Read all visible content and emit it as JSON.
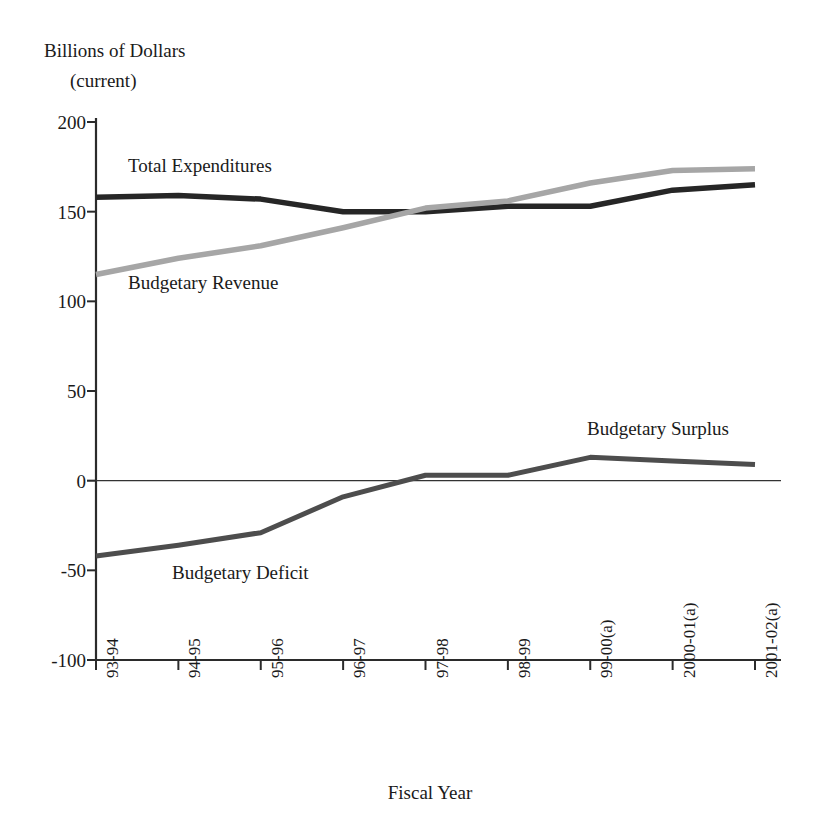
{
  "chart_data": {
    "type": "line",
    "title": "",
    "ylabel": "Billions of Dollars",
    "ylabel_line2": "(current)",
    "xlabel": "Fiscal Year",
    "categories": [
      "93-94",
      "94-95",
      "95-96",
      "96-97",
      "97-98",
      "98-99",
      "99-00(a)",
      "2000-01(a)",
      "2001-02(a)"
    ],
    "ylim": [
      -100,
      200
    ],
    "yticks": [
      200,
      150,
      100,
      50,
      0,
      -50,
      -100
    ],
    "ytick_labels": [
      "200",
      "150",
      "100",
      "50",
      "0",
      "-50",
      "-100"
    ],
    "grid": false,
    "legend_position": "inline-annotations",
    "series": [
      {
        "name": "Total Expenditures",
        "color": "#262626",
        "values": [
          158,
          159,
          157,
          150,
          150,
          153,
          153,
          162,
          165
        ]
      },
      {
        "name": "Budgetary Revenue",
        "color": "#a6a6a6",
        "values": [
          115,
          124,
          131,
          141,
          152,
          156,
          166,
          173,
          174
        ]
      },
      {
        "name": "Budgetary Balance",
        "color": "#4d4d4d",
        "values": [
          -42,
          -36,
          -29,
          -9,
          3,
          3,
          13,
          11,
          9
        ]
      }
    ],
    "annotations": [
      {
        "text": "Total Expenditures",
        "series": "Total Expenditures"
      },
      {
        "text": "Budgetary Revenue",
        "series": "Budgetary Revenue"
      },
      {
        "text": "Budgetary Deficit",
        "series": "Budgetary Balance"
      },
      {
        "text": "Budgetary Surplus",
        "series": "Budgetary Balance"
      }
    ]
  },
  "axis": {
    "y_title": "Billions of Dollars",
    "y_title_line2": "(current)",
    "x_title": "Fiscal Year",
    "y_ticks": [
      "200",
      "150",
      "100",
      "50",
      "0",
      "-50",
      "-100"
    ],
    "x_ticks": [
      "93-94",
      "94-95",
      "95-96",
      "96-97",
      "97-98",
      "98-99",
      "99-00(a)",
      "2000-01(a)",
      "2001-02(a)"
    ]
  },
  "labels": {
    "expenditures": "Total Expenditures",
    "revenue": "Budgetary Revenue",
    "deficit": "Budgetary Deficit",
    "surplus": "Budgetary Surplus"
  },
  "colors": {
    "expenditures": "#262626",
    "revenue": "#a6a6a6",
    "balance": "#4d4d4d",
    "axis": "#2b2b2b",
    "background": "#ffffff"
  }
}
